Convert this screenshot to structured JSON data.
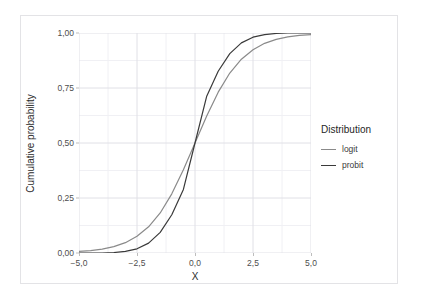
{
  "top_sliver_text": "",
  "axes": {
    "x_title": "X",
    "y_title": "Cumulative probability",
    "x_ticks": [
      "−5,0",
      "−2,5",
      "0,0",
      "2,5",
      "5,0"
    ],
    "y_ticks": [
      "0,00",
      "0,25",
      "0,50",
      "0,75",
      "1,00"
    ]
  },
  "legend": {
    "title": "Distribution",
    "items": [
      {
        "label": "logit",
        "color": "#8a8a8a"
      },
      {
        "label": "probit",
        "color": "#3a3a3a"
      }
    ]
  },
  "colors": {
    "panel_background": "#ffffff",
    "grid_major": "#e0e0e6",
    "grid_minor": "#f0f0f4",
    "figure_border": "#e3e3e6",
    "text": "#4d4d4d"
  },
  "chart_data": {
    "type": "line",
    "title": "",
    "xlabel": "X",
    "ylabel": "Cumulative probability",
    "xlim": [
      -5.0,
      5.0
    ],
    "ylim": [
      0.0,
      1.0
    ],
    "xticks": [
      -5.0,
      -2.5,
      0.0,
      2.5,
      5.0
    ],
    "yticks": [
      0.0,
      0.25,
      0.5,
      0.75,
      1.0
    ],
    "grid": true,
    "legend_position": "right",
    "x": [
      -5.0,
      -4.5,
      -4.0,
      -3.5,
      -3.0,
      -2.5,
      -2.0,
      -1.5,
      -1.0,
      -0.5,
      0.0,
      0.5,
      1.0,
      1.5,
      2.0,
      2.5,
      3.0,
      3.5,
      4.0,
      4.5,
      5.0
    ],
    "series": [
      {
        "name": "logit",
        "color": "#8a8a8a",
        "values": [
          0.007,
          0.011,
          0.018,
          0.029,
          0.047,
          0.076,
          0.119,
          0.182,
          0.269,
          0.378,
          0.5,
          0.622,
          0.731,
          0.818,
          0.881,
          0.924,
          0.953,
          0.971,
          0.982,
          0.989,
          0.993
        ]
      },
      {
        "name": "probit",
        "color": "#3a3a3a",
        "values": [
          0.0,
          0.0,
          0.0,
          0.002,
          0.007,
          0.019,
          0.045,
          0.094,
          0.174,
          0.289,
          0.5,
          0.711,
          0.826,
          0.906,
          0.955,
          0.981,
          0.993,
          0.998,
          1.0,
          1.0,
          1.0
        ]
      }
    ]
  }
}
